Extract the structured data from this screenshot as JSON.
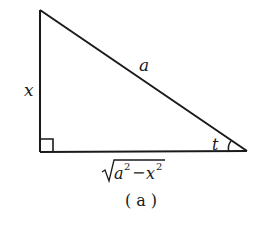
{
  "figure": {
    "type": "right-triangle",
    "caption": "( a )",
    "colors": {
      "stroke": "#1a1a1a",
      "background": "#ffffff"
    },
    "vertices": {
      "top": [
        40,
        10
      ],
      "right_angle": [
        40,
        152
      ],
      "acute": [
        247,
        151
      ]
    },
    "labels": {
      "vertical_side": "x",
      "hypotenuse": "a",
      "angle": "t",
      "base_radicand_a": "a",
      "base_exp1": "2",
      "base_minus": "−",
      "base_radicand_x": "x",
      "base_exp2": "2"
    },
    "right_angle_marker": true,
    "angle_arc_at": "acute"
  }
}
